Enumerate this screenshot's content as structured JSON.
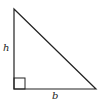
{
  "diagram": {
    "type": "right-triangle",
    "labels": {
      "height": "h",
      "base": "b"
    },
    "vertices": {
      "top": [
        14,
        9
      ],
      "bottom_left": [
        14,
        89
      ],
      "bottom_right": [
        96,
        89
      ]
    },
    "right_angle_marker": true,
    "stroke_color": "#222222",
    "background": "#ffffff"
  }
}
